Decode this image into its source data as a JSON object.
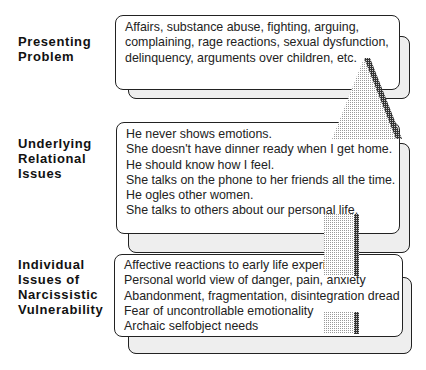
{
  "levels": [
    {
      "label": [
        "Presenting",
        "Problem"
      ],
      "lines": [
        "Affairs, substance abuse, fighting, arguing,",
        "complaining, rage reactions, sexual dysfunction,",
        "delinquency, arguments over children, etc."
      ]
    },
    {
      "label": [
        "Underlying",
        "Relational",
        "Issues"
      ],
      "lines": [
        "He never shows emotions.",
        "She doesn't have dinner ready when I get home.",
        "He should know how I feel.",
        "She talks on the phone to her friends all the time.",
        "He ogles other women.",
        "She talks to others about our personal life."
      ]
    },
    {
      "label": [
        "Individual",
        "Issues of",
        "Narcissistic",
        "Vulnerability"
      ],
      "lines": [
        "Affective reactions to early life experiences",
        "Personal world view of danger, pain, anxiety",
        "Abandonment, fragmentation, disintegration dread",
        "Fear of uncontrollable emotionality",
        "Archaic selfobject needs"
      ]
    }
  ],
  "colors": {
    "border": "#222222",
    "shadow": "#555555",
    "arrow": "#cccccc"
  }
}
